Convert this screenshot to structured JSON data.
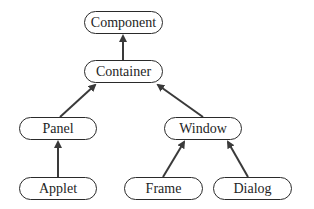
{
  "diagram": {
    "type": "class-hierarchy",
    "colors": {
      "stroke": "#2a2a2a",
      "arrow": "#3a3a3a",
      "text": "#1e1e1e",
      "background": "#ffffff"
    },
    "nodes": [
      {
        "id": "component",
        "label": "Component",
        "x": 84,
        "y": 11,
        "w": 79,
        "h": 23
      },
      {
        "id": "container",
        "label": "Container",
        "x": 84,
        "y": 60,
        "w": 79,
        "h": 23
      },
      {
        "id": "panel",
        "label": "Panel",
        "x": 19,
        "y": 117,
        "w": 78,
        "h": 23
      },
      {
        "id": "window",
        "label": "Window",
        "x": 164,
        "y": 117,
        "w": 78,
        "h": 23
      },
      {
        "id": "applet",
        "label": "Applet",
        "x": 19,
        "y": 177,
        "w": 78,
        "h": 23
      },
      {
        "id": "frame",
        "label": "Frame",
        "x": 124,
        "y": 177,
        "w": 79,
        "h": 23
      },
      {
        "id": "dialog",
        "label": "Dialog",
        "x": 213,
        "y": 177,
        "w": 79,
        "h": 23
      }
    ],
    "edges": [
      {
        "from": "container",
        "to": "component"
      },
      {
        "from": "panel",
        "to": "container"
      },
      {
        "from": "window",
        "to": "container"
      },
      {
        "from": "applet",
        "to": "panel"
      },
      {
        "from": "frame",
        "to": "window"
      },
      {
        "from": "dialog",
        "to": "window"
      }
    ]
  }
}
